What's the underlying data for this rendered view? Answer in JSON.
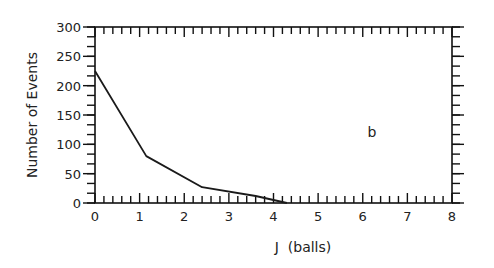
{
  "chart_data": {
    "type": "line",
    "title": "",
    "annotation": "b",
    "xlabel": "J  (balls)",
    "ylabel": "Number of Events",
    "xlim": [
      0,
      8
    ],
    "ylim": [
      0,
      300
    ],
    "x_ticks": [
      0,
      1,
      2,
      3,
      4,
      5,
      6,
      7,
      8
    ],
    "x_tick_labels": [
      "0",
      "1",
      "2",
      "3",
      "4",
      "5",
      "6",
      "7",
      "8"
    ],
    "y_ticks": [
      0,
      50,
      100,
      150,
      200,
      250,
      300
    ],
    "y_tick_labels": [
      "0",
      "50",
      "100",
      "150",
      "200",
      "250",
      "300"
    ],
    "x_minor_step": 0.2,
    "y_minor_step": 16.667,
    "grid": false,
    "legend": null,
    "series": [
      {
        "name": "events",
        "x": [
          0,
          1.15,
          2.4,
          3.6,
          4.3
        ],
        "values": [
          225,
          80,
          27,
          12,
          0
        ]
      }
    ]
  },
  "layout": {
    "plot_left": 95,
    "plot_right": 452,
    "plot_top": 27,
    "plot_bottom": 203,
    "annotation_pos": [
      372,
      137
    ]
  }
}
